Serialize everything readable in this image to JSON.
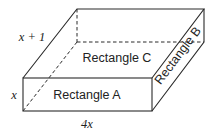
{
  "diagram": {
    "type": "rectangular-prism",
    "faces": {
      "front": "Rectangle A",
      "side": "Rectangle B",
      "top": "Rectangle C"
    },
    "dimensions": {
      "height": "x",
      "depth": "x + 1",
      "length": "4x"
    },
    "colors": {
      "line": "#2a2a2a",
      "text": "#222222",
      "background": "#ffffff"
    }
  }
}
